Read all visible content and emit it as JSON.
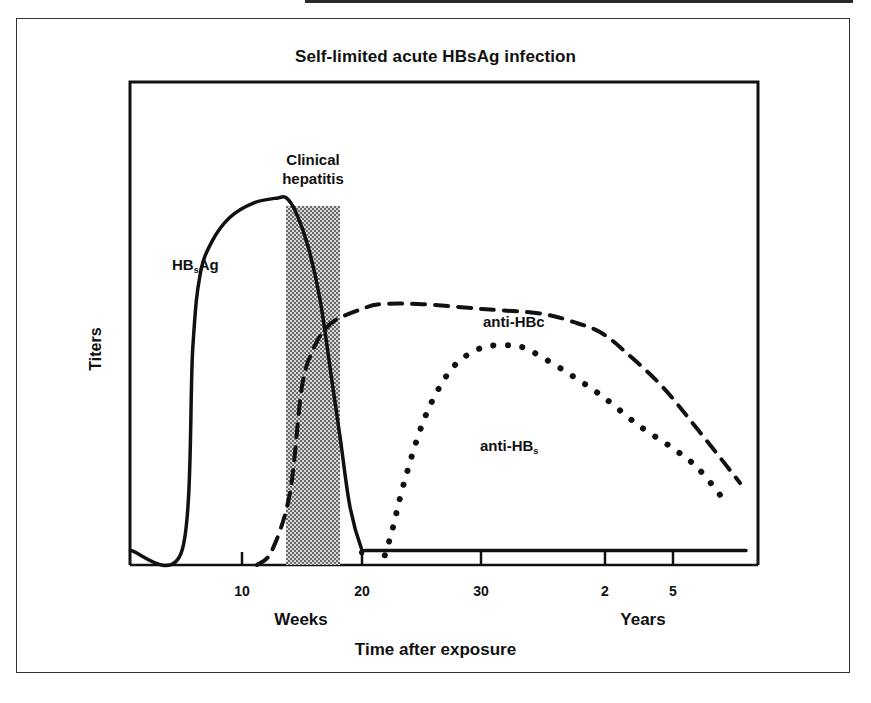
{
  "chart_data": {
    "type": "line",
    "title": "Self-limited acute HBsAg infection",
    "xlabel": "Time after exposure",
    "ylabel": "Titers",
    "x_unit_labels": {
      "weeks": "Weeks",
      "years": "Years"
    },
    "x_ticks": [
      {
        "label": "10",
        "unit": "weeks",
        "week_position": 10
      },
      {
        "label": "20",
        "unit": "weeks",
        "week_position": 20
      },
      {
        "label": "30",
        "unit": "weeks",
        "week_position": 30
      },
      {
        "label": "2",
        "unit": "years",
        "week_position": 40.3
      },
      {
        "label": "5",
        "unit": "years",
        "week_position": 45.9
      }
    ],
    "xlim_weeks": [
      0.7,
      53
    ],
    "ylim": [
      0,
      100
    ],
    "y_ticks": [],
    "grid": false,
    "legend": "inline labels",
    "annotations": [
      {
        "text": "Clinical hepatitis",
        "type": "shaded_band",
        "x_start_week": 13.7,
        "x_end_week": 18.2,
        "pattern": "stipple"
      }
    ],
    "series": [
      {
        "name": "HBsAg",
        "display_label": "HB",
        "display_sub": "s",
        "display_suffix": "Ag",
        "style": "solid",
        "x_weeks": [
          0.7,
          5,
          5.9,
          6.5,
          7.5,
          9,
          11,
          13,
          13.7,
          14.5,
          15.5,
          16.5,
          17.5,
          18.2,
          19,
          20,
          20.3,
          25,
          30,
          35,
          40,
          45,
          50,
          52
        ],
        "values": [
          3,
          3,
          45,
          60,
          67,
          72,
          75,
          76,
          76,
          73,
          66,
          55,
          38,
          26,
          12,
          3,
          3,
          3,
          3,
          3,
          3,
          3,
          3,
          3
        ]
      },
      {
        "name": "anti-HBc",
        "display_label": "anti-HBc",
        "style": "dashed",
        "x_weeks": [
          11.25,
          12.5,
          14,
          15,
          16,
          17,
          18,
          20,
          21.5,
          25,
          30,
          35,
          38,
          40,
          42,
          45,
          48,
          51.5
        ],
        "values": [
          0,
          3,
          15,
          37,
          45,
          49,
          51,
          53,
          54,
          54,
          53,
          52,
          50,
          48,
          44,
          37,
          28,
          17
        ]
      },
      {
        "name": "anti-HBs",
        "display_label": "anti-HB",
        "display_sub": "s",
        "style": "dotted",
        "x_weeks": [
          21.9,
          22.5,
          23.5,
          25,
          26.5,
          28,
          30,
          32,
          33.5,
          35,
          37,
          40,
          43,
          46,
          48,
          50
        ],
        "values": [
          2,
          7,
          17,
          29,
          37,
          42,
          45,
          45.5,
          45,
          43,
          40,
          35,
          29,
          24,
          20,
          14
        ]
      }
    ]
  },
  "labels": {
    "title": "Self-limited acute HBsAg infection",
    "ylabel": "Titers",
    "xlabel": "Time after exposure",
    "shade_line1": "Clinical",
    "shade_line2": "hepatitis",
    "hbsag_main": "HB",
    "hbsag_sub": "s",
    "hbsag_suffix": "Ag",
    "antihbc": "anti-HBc",
    "antihbs_main": "anti-HB",
    "antihbs_sub": "s",
    "weeks": "Weeks",
    "years": "Years",
    "ticks": [
      "10",
      "20",
      "30",
      "2",
      "5"
    ]
  },
  "colors": {
    "ink": "#111111",
    "shade": "#6e6e6e",
    "background": "#ffffff"
  }
}
